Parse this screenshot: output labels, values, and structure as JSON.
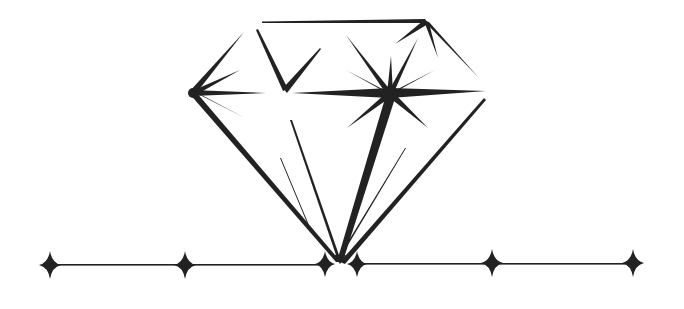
{
  "illustration": {
    "subject": "diamond",
    "ink_color": "#222222",
    "background_color": "#ffffff",
    "baseline_sparkles": 6
  }
}
